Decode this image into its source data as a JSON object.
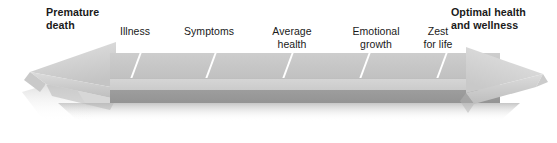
{
  "diagram": {
    "type": "double-headed-arrow-continuum",
    "left_endpoint": {
      "label": "Premature\ndeath",
      "emphasis": "bold"
    },
    "right_endpoint": {
      "label": "Optimal health\nand wellness",
      "emphasis": "bold"
    },
    "stages": [
      {
        "label": "Illness"
      },
      {
        "label": "Symptoms"
      },
      {
        "label": "Average\nhealth"
      },
      {
        "label": "Emotional\ngrowth"
      },
      {
        "label": "Zest\nfor life"
      }
    ],
    "tick_count": 5,
    "colors": {
      "arrow_top_face": "#c7c7c7",
      "arrow_bevel_face": "#d2d2d2",
      "arrow_bottom_face": "#989898",
      "arrow_head_light": "#d8d8d8",
      "arrow_head_mid": "#bdbdbd",
      "tick_mark": "#ffffff",
      "text": "#1a1a1a",
      "background": "#ffffff",
      "shadow": "#b8b8b8"
    }
  }
}
